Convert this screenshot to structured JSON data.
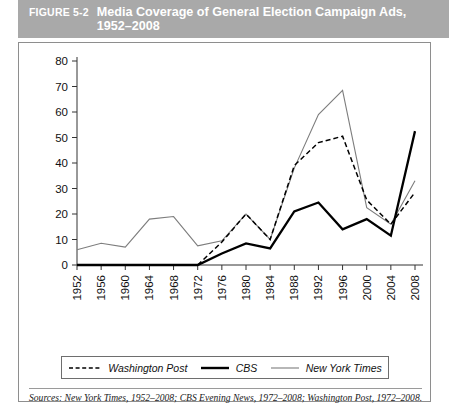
{
  "header": {
    "figure_number": "FIGURE 5-2",
    "title": "Media Coverage of General Election Campaign Ads, 1952–2008",
    "band_color": "#a9a9a9",
    "text_color": "#ffffff"
  },
  "source_note": "Sources: New York Times, 1952–2008; CBS Evening News, 1972–2008; Washington Post, 1972–2008.",
  "legend": {
    "items": [
      {
        "label": "Washington Post",
        "style": "dashed",
        "color": "#000000"
      },
      {
        "label": "CBS",
        "style": "solid-thick",
        "color": "#000000"
      },
      {
        "label": "New York Times",
        "style": "solid-thin",
        "color": "#7d7d7d"
      }
    ]
  },
  "chart_data": {
    "type": "line",
    "title": "Media Coverage of General Election Campaign Ads, 1952–2008",
    "xlabel": "",
    "ylabel": "",
    "xlim": [
      1952,
      2008
    ],
    "ylim": [
      0,
      80
    ],
    "ytick_step": 10,
    "grid": false,
    "legend_position": "bottom",
    "categories": [
      1952,
      1956,
      1960,
      1964,
      1968,
      1972,
      1976,
      1980,
      1984,
      1988,
      1992,
      1996,
      2000,
      2004,
      2008
    ],
    "x": [
      "1952",
      "1956",
      "1960",
      "1964",
      "1968",
      "1972",
      "1976",
      "1980",
      "1984",
      "1988",
      "1992",
      "1996",
      "2000",
      "2004",
      "2008"
    ],
    "yticks": [
      0,
      10,
      20,
      30,
      40,
      50,
      60,
      70,
      80
    ],
    "ytick_labels": [
      "0",
      "10",
      "20",
      "30",
      "40",
      "50",
      "60",
      "70",
      "80"
    ],
    "series": [
      {
        "name": "New York Times",
        "style": "solid-thin",
        "color": "#7d7d7d",
        "values": [
          6,
          8.5,
          7,
          18,
          19,
          7.5,
          9.5,
          20,
          10,
          38,
          59,
          68.5,
          22.5,
          16,
          33
        ]
      },
      {
        "name": "Washington Post",
        "style": "dashed",
        "color": "#000000",
        "values": [
          null,
          null,
          null,
          null,
          null,
          0,
          9,
          20,
          10,
          39,
          48,
          50.5,
          25.5,
          16,
          28.5
        ]
      },
      {
        "name": "CBS",
        "style": "solid-thick",
        "color": "#000000",
        "values": [
          0,
          0,
          0,
          0,
          0,
          0,
          4.5,
          8.5,
          6.5,
          21,
          24.5,
          14,
          18,
          11.5,
          52.5
        ]
      }
    ]
  }
}
